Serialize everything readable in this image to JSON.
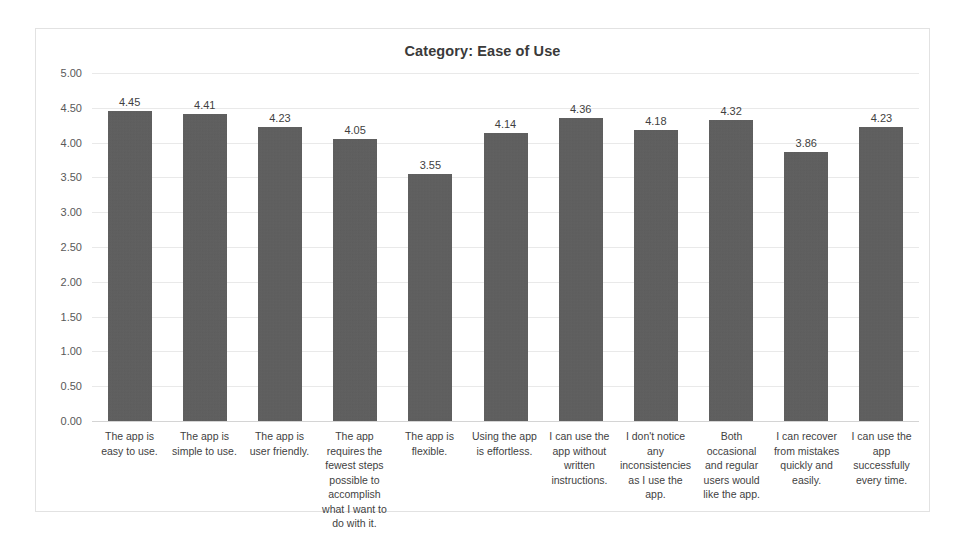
{
  "chart_data": {
    "type": "bar",
    "title": "Category: Ease of Use",
    "xlabel": "",
    "ylabel": "",
    "ylim": [
      0,
      5
    ],
    "ytick_step": 0.5,
    "ytick_labels": [
      "5.00",
      "4.50",
      "4.00",
      "3.50",
      "3.00",
      "2.50",
      "2.00",
      "1.50",
      "1.00",
      "0.50",
      "0.00"
    ],
    "grid": true,
    "legend": false,
    "bar_color": "#5c5c5c",
    "categories": [
      "The app is easy to use.",
      "The app is simple to use.",
      "The app is user friendly.",
      "The app requires the fewest steps possible to accomplish what I want to do with it.",
      "The app is flexible.",
      "Using the app is effortless.",
      "I can use the app without written instructions.",
      "I don't notice any inconsistencies as I use the app.",
      "Both occasional and regular users would like the app.",
      "I can recover from mistakes quickly and easily.",
      "I can use the app successfully every time."
    ],
    "values": [
      4.45,
      4.41,
      4.23,
      4.05,
      3.55,
      4.14,
      4.36,
      4.18,
      4.32,
      3.86,
      4.23
    ],
    "value_labels": [
      "4.45",
      "4.41",
      "4.23",
      "4.05",
      "3.55",
      "4.14",
      "4.36",
      "4.18",
      "4.32",
      "3.86",
      "4.23"
    ]
  }
}
